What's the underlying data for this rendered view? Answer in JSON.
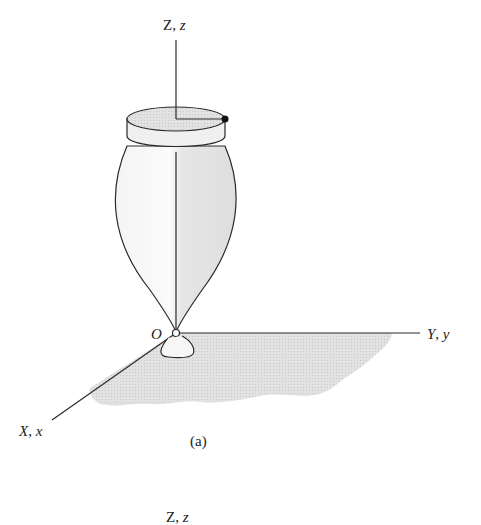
{
  "figure": {
    "part_a": {
      "caption": "(a)",
      "axes": {
        "z_label_upper": "Z",
        "z_label_lower": "z",
        "y_label_upper": "Y",
        "y_label_lower": "y",
        "x_label_upper": "X",
        "x_label_lower": "x",
        "origin_label": "O"
      }
    },
    "part_b": {
      "axes": {
        "z_label_upper": "Z",
        "z_label_lower": "z"
      }
    },
    "colors": {
      "line": "#2a2a2a",
      "shading": "#d9d9d9",
      "body_fill": "#ececec"
    }
  }
}
